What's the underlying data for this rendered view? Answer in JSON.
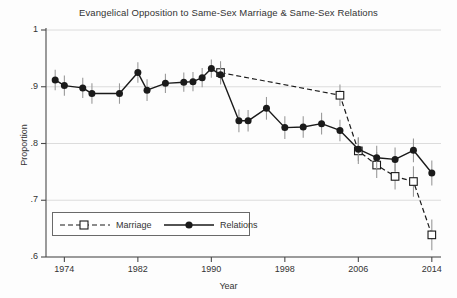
{
  "chart_data": {
    "type": "line",
    "title": "Evangelical Opposition to Same-Sex Marriage & Same-Sex Relations",
    "xlabel": "Year",
    "ylabel": "Proportion",
    "xlim": [
      1972,
      2015
    ],
    "ylim": [
      0.6,
      1.0
    ],
    "grid": true,
    "grid_axis": "y",
    "legend_position": "lower-left",
    "xticks": [
      1974,
      1982,
      1990,
      1998,
      2006,
      2014
    ],
    "xtick_labels": [
      "1974",
      "1982",
      "1990",
      "1998",
      "2006",
      "2014"
    ],
    "yticks": [
      0.6,
      0.7,
      0.8,
      0.9,
      1.0
    ],
    "ytick_labels": [
      ".6",
      ".7",
      ".8",
      ".9",
      "1"
    ],
    "series": [
      {
        "name": "Marriage",
        "style": "dashed",
        "marker": "open-square",
        "x": [
          1991,
          2004,
          2006,
          2008,
          2010,
          2012,
          2014
        ],
        "y": [
          0.925,
          0.885,
          0.787,
          0.762,
          0.742,
          0.733,
          0.639
        ],
        "error_low": [
          0.905,
          0.866,
          0.764,
          0.739,
          0.719,
          0.706,
          0.612
        ],
        "error_high": [
          0.945,
          0.904,
          0.81,
          0.785,
          0.765,
          0.76,
          0.666
        ]
      },
      {
        "name": "Relations",
        "style": "solid",
        "marker": "filled-circle",
        "x": [
          1973,
          1974,
          1976,
          1977,
          1980,
          1982,
          1983,
          1985,
          1987,
          1988,
          1989,
          1990,
          1991,
          1993,
          1994,
          1996,
          1998,
          2000,
          2002,
          2004,
          2006,
          2008,
          2010,
          2012,
          2014
        ],
        "y": [
          0.912,
          0.902,
          0.898,
          0.888,
          0.888,
          0.925,
          0.894,
          0.906,
          0.908,
          0.909,
          0.916,
          0.932,
          0.921,
          0.84,
          0.84,
          0.862,
          0.828,
          0.829,
          0.835,
          0.823,
          0.79,
          0.775,
          0.772,
          0.788,
          0.748
        ],
        "error_low": [
          0.894,
          0.884,
          0.88,
          0.87,
          0.87,
          0.907,
          0.875,
          0.889,
          0.891,
          0.892,
          0.899,
          0.916,
          0.904,
          0.82,
          0.821,
          0.842,
          0.808,
          0.81,
          0.816,
          0.804,
          0.769,
          0.754,
          0.751,
          0.767,
          0.726
        ],
        "error_high": [
          0.93,
          0.92,
          0.916,
          0.906,
          0.906,
          0.943,
          0.913,
          0.923,
          0.925,
          0.926,
          0.933,
          0.948,
          0.938,
          0.86,
          0.859,
          0.882,
          0.848,
          0.848,
          0.854,
          0.842,
          0.811,
          0.796,
          0.793,
          0.809,
          0.77
        ]
      }
    ]
  },
  "legend": {
    "marriage_label": "Marriage",
    "relations_label": "Relations"
  },
  "colors": {
    "line": "#1a1a1a",
    "error_bar": "#9a9a9a",
    "grid": "#d8d8d8",
    "axis": "#4a4a4a",
    "text": "#333333"
  }
}
